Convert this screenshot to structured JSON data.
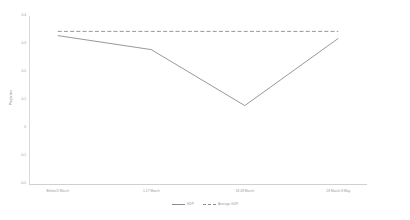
{
  "chart_data": {
    "type": "line",
    "title": "",
    "xlabel": "",
    "ylabel": "Proportion",
    "categories": [
      "Before/1 March",
      "1-17 March",
      "18-28 March",
      "28 March-8 May"
    ],
    "ylim": [
      -0.2,
      0.4
    ],
    "yticks": [
      0.4,
      0.3,
      0.2,
      0.1,
      0,
      -0.1,
      -0.2
    ],
    "ytick_labels": [
      "0.4",
      "0.3",
      "0.2",
      "0.1",
      "0",
      "-0.1",
      "-0.2"
    ],
    "grid": false,
    "legend_position": "bottom",
    "series": [
      {
        "name": "GDP",
        "style": "solid",
        "color": "#8c8c8c",
        "values": [
          0.33,
          0.28,
          0.08,
          0.32
        ]
      },
      {
        "name": "Average GDP",
        "style": "dashed",
        "color": "#8c8c8c",
        "values": [
          0.345,
          0.345,
          0.345,
          0.345
        ]
      }
    ]
  },
  "legend": {
    "entries": [
      {
        "label": "GDP",
        "style": "solid"
      },
      {
        "label": "Average GDP",
        "style": "dashed"
      }
    ]
  }
}
